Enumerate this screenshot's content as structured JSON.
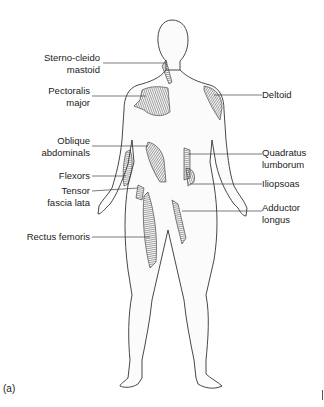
{
  "figure": {
    "panel_label": "(a)",
    "colors": {
      "outline": "#333333",
      "muscle_shading": "#555555",
      "leader_line": "#444444",
      "background": "#ffffff"
    }
  },
  "labels_left": [
    {
      "line1": "Sterno-cleido",
      "line2": "mastoid"
    },
    {
      "line1": "Pectoralis",
      "line2": "major"
    },
    {
      "line1": "Oblique",
      "line2": "abdominals"
    },
    {
      "line1": "Flexors",
      "line2": ""
    },
    {
      "line1": "Tensor",
      "line2": "fascia lata"
    },
    {
      "line1": "Rectus femoris",
      "line2": ""
    }
  ],
  "labels_right": [
    {
      "line1": "Deltoid",
      "line2": ""
    },
    {
      "line1": "Quadratus",
      "line2": "lumborum"
    },
    {
      "line1": "Iliopsoas",
      "line2": ""
    },
    {
      "line1": "Adductor",
      "line2": "longus"
    }
  ]
}
